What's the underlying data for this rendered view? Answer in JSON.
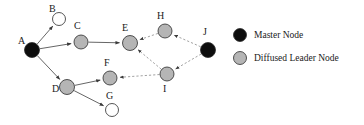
{
  "diagram": {
    "title_text": "",
    "node_styles": {
      "master": {
        "fill": "#0d0d0d",
        "stroke": "#0d0d0d",
        "legend_label": "Master Node"
      },
      "diffused_leader": {
        "fill": "#b5b5b5",
        "stroke": "#6e6e6e",
        "legend_label": "Diffused Leader Node"
      },
      "plain": {
        "fill": "#ffffff",
        "stroke": "#3a3a3a",
        "legend_label": ""
      }
    },
    "nodes": [
      {
        "id": "A",
        "label": "A",
        "x": 32,
        "y": 50,
        "r": 7.5,
        "type": "master",
        "label_x": 18,
        "label_y": 44
      },
      {
        "id": "B",
        "label": "B",
        "x": 59,
        "y": 19,
        "r": 6.5,
        "type": "plain",
        "label_x": 49,
        "label_y": 12
      },
      {
        "id": "C",
        "label": "C",
        "x": 81,
        "y": 42,
        "r": 7.0,
        "type": "diffused_leader",
        "label_x": 74,
        "label_y": 29
      },
      {
        "id": "D",
        "label": "D",
        "x": 67,
        "y": 87,
        "r": 7.5,
        "type": "diffused_leader",
        "label_x": 52,
        "label_y": 92
      },
      {
        "id": "E",
        "label": "E",
        "x": 130,
        "y": 43,
        "r": 7.5,
        "type": "diffused_leader",
        "label_x": 122,
        "label_y": 31
      },
      {
        "id": "F",
        "label": "F",
        "x": 110,
        "y": 78,
        "r": 7.0,
        "type": "diffused_leader",
        "label_x": 104,
        "label_y": 66
      },
      {
        "id": "G",
        "label": "G",
        "x": 112,
        "y": 110,
        "r": 6.5,
        "type": "plain",
        "label_x": 106,
        "label_y": 99
      },
      {
        "id": "H",
        "label": "H",
        "x": 165,
        "y": 31,
        "r": 7.0,
        "type": "diffused_leader",
        "label_x": 157,
        "label_y": 19
      },
      {
        "id": "I",
        "label": "I",
        "x": 167,
        "y": 74,
        "r": 7.0,
        "type": "diffused_leader",
        "label_x": 163,
        "label_y": 92
      },
      {
        "id": "J",
        "label": "J",
        "x": 208,
        "y": 50,
        "r": 7.5,
        "type": "master",
        "label_x": 203,
        "label_y": 35
      }
    ],
    "edges": [
      {
        "from": "A",
        "to": "B",
        "style": "solid",
        "arrow": true
      },
      {
        "from": "A",
        "to": "C",
        "style": "solid",
        "arrow": true
      },
      {
        "from": "C",
        "to": "E",
        "style": "solid",
        "arrow": true
      },
      {
        "from": "A",
        "to": "D",
        "style": "solid",
        "arrow": true
      },
      {
        "from": "D",
        "to": "F",
        "style": "solid",
        "arrow": true
      },
      {
        "from": "D",
        "to": "G",
        "style": "solid",
        "arrow": true
      },
      {
        "from": "J",
        "to": "H",
        "style": "dashed",
        "arrow": true
      },
      {
        "from": "H",
        "to": "E",
        "style": "dashed",
        "arrow": true
      },
      {
        "from": "J",
        "to": "I",
        "style": "dashed",
        "arrow": true
      },
      {
        "from": "I",
        "to": "E",
        "style": "dashed",
        "arrow": true
      },
      {
        "from": "I",
        "to": "F",
        "style": "dashed",
        "arrow": true
      }
    ],
    "legend": {
      "items": [
        {
          "key": "master",
          "label": "Master Node",
          "marker_x": 240,
          "marker_y": 35,
          "r": 6.5,
          "text_x": 254,
          "text_y": 38
        },
        {
          "key": "diffused_leader",
          "label": "Diffused Leader Node",
          "marker_x": 240,
          "marker_y": 58,
          "r": 6.5,
          "text_x": 254,
          "text_y": 61
        }
      ]
    }
  }
}
